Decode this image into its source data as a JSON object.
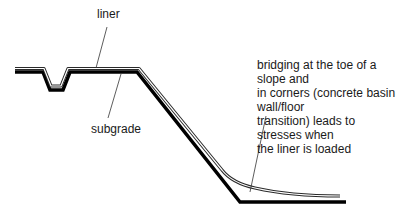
{
  "diagram": {
    "type": "cross-section",
    "labels": {
      "liner": "liner",
      "subgrade": "subgrade",
      "annotation": [
        "bridging at the toe of a slope and",
        "in corners (concrete basin wall/floor",
        "transition) leads to stresses when",
        "the liner is loaded"
      ]
    },
    "colors": {
      "subgrade": "#000000",
      "liner": "#2a2a2a",
      "leader": "#333333",
      "background": "#ffffff"
    }
  }
}
